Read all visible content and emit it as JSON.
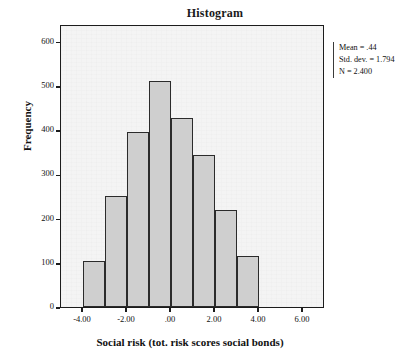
{
  "chart_data": {
    "type": "bar",
    "title": "Histogram",
    "xlabel": "Social risk (tot. risk scores social bonds)",
    "ylabel": "Frequency",
    "categories": [
      "-3.5",
      "-2.5",
      "-1.5",
      "-0.5",
      "0.5",
      "1.5",
      "2.5",
      "3.5"
    ],
    "values": [
      105,
      250,
      395,
      510,
      428,
      343,
      220,
      115
    ],
    "xlim": [
      -5.0,
      7.0
    ],
    "ylim": [
      0,
      640
    ],
    "x_ticks": [
      "-4.00",
      "-2.00",
      ".00",
      "2.00",
      "4.00",
      "6.00"
    ],
    "x_tick_values": [
      -4.0,
      -2.0,
      0.0,
      2.0,
      4.0,
      6.0
    ],
    "y_ticks": [
      "0",
      "100",
      "200",
      "300",
      "400",
      "500",
      "600"
    ],
    "y_tick_values": [
      0,
      100,
      200,
      300,
      400,
      500,
      600
    ],
    "grid": false,
    "legend": "none",
    "bar_fill": "#cfcfcf",
    "bar_edge": "#2b2b2b",
    "plot_background": "#f4f4f4",
    "annotations": {
      "mean_label": "Mean = .44",
      "std_label": "Std. dev. = 1.794",
      "n_label": "N = 2.400"
    }
  }
}
